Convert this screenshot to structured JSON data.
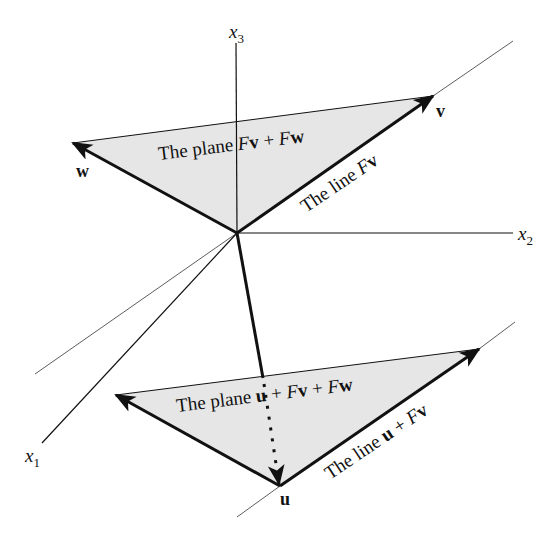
{
  "diagram": {
    "type": "3d-affine-subspace-diagram",
    "colors": {
      "plane_fill": "#e6e6e6",
      "line": "#111111",
      "background": "#ffffff"
    },
    "axes": {
      "x1": {
        "label": "x",
        "sub": "1"
      },
      "x2": {
        "label": "x",
        "sub": "2"
      },
      "x3": {
        "label": "x",
        "sub": "3"
      }
    },
    "upper_plane": {
      "text_prefix": "The plane ",
      "F1": "F",
      "v1": "v",
      "plus": " + ",
      "F2": "F",
      "w1": "w"
    },
    "upper_line": {
      "text_prefix": "The line ",
      "F": "F",
      "v": "v"
    },
    "lower_plane": {
      "text_prefix": "The plane ",
      "u": "u",
      "plus1": " + ",
      "F1": "F",
      "v": "v",
      "plus2": " + ",
      "F2": "F",
      "w": "w"
    },
    "lower_line": {
      "text_prefix": "The line ",
      "u": "u",
      "plus": " + ",
      "F": "F",
      "v": "v"
    },
    "vector_labels": {
      "v": "v",
      "w": "w",
      "u": "u"
    }
  }
}
